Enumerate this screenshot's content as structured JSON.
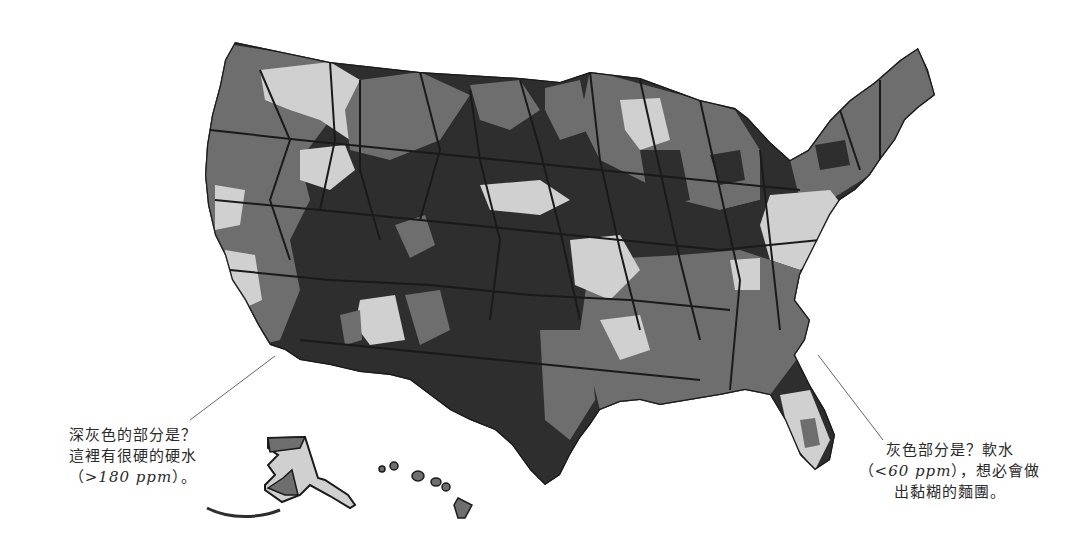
{
  "map": {
    "subject": "United States water hardness map",
    "legend_colors": {
      "very_hard": "#2e2e2e",
      "hard": "#6e6e6e",
      "soft": "#d0d0d0",
      "border": "#1a1a1a"
    },
    "regions": [
      "contiguous-us",
      "alaska",
      "hawaii"
    ]
  },
  "annotations": {
    "hard_water": {
      "line1": "深灰色的部分是？",
      "line2": "這裡有很硬的硬水",
      "line3_open": "（",
      "line3_ppm": ">180 ppm",
      "line3_close": "）。"
    },
    "soft_water": {
      "line1": "灰色部分是？軟水",
      "line2_open": "（",
      "line2_ppm": "<60 ppm",
      "line2_close": "），想必會做",
      "line3": "出黏糊的麵團。"
    }
  }
}
